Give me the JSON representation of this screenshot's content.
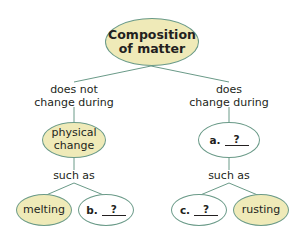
{
  "colors": {
    "filled_node": "#efeab8",
    "empty_node": "#ffffff",
    "outline": "#6a9a88",
    "text": "#231f20"
  },
  "root": {
    "line1": "Composition",
    "line2": "of matter"
  },
  "left_branch": {
    "link_line1": "does not",
    "link_line2": "change during",
    "node_line1": "physical",
    "node_line2": "change",
    "connector": "such as",
    "children": [
      {
        "type": "filled",
        "text": "melting"
      },
      {
        "type": "blank",
        "letter": "b.",
        "blank": "?"
      }
    ]
  },
  "right_branch": {
    "link_line1": "does",
    "link_line2": "change during",
    "node_letter": "a.",
    "node_blank": "?",
    "connector": "such as",
    "children": [
      {
        "type": "blank",
        "letter": "c.",
        "blank": "?"
      },
      {
        "type": "filled",
        "text": "rusting"
      }
    ]
  }
}
